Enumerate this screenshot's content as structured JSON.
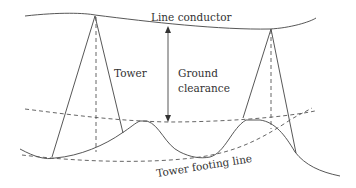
{
  "diagram": {
    "labels": {
      "line_conductor": "Line conductor",
      "tower": "Tower",
      "ground_clearance_1": "Ground",
      "ground_clearance_2": "clearance",
      "tower_footing_line": "Tower footing line"
    },
    "colors": {
      "line": "#444444",
      "text": "#333333",
      "background": "#ffffff"
    }
  }
}
